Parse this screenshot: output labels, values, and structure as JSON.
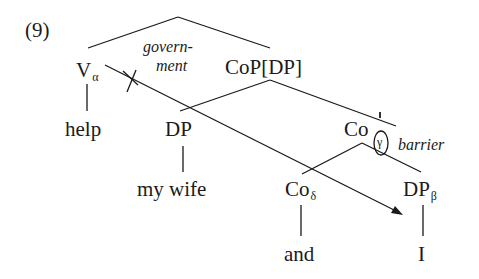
{
  "example": {
    "number": "(9)"
  },
  "nodes": {
    "v": {
      "label": "V",
      "subscript": "α"
    },
    "cop": {
      "label": "CoP[DP]"
    },
    "dp1": {
      "label": "DP"
    },
    "cobar": {
      "label": "Co",
      "prime": "'",
      "circled": "γ"
    },
    "co": {
      "label": "Co",
      "subscript": "δ"
    },
    "dp2": {
      "label": "DP",
      "subscript": "β"
    }
  },
  "leaves": {
    "help": "help",
    "my_wife": "my wife",
    "and": "and",
    "i": "I"
  },
  "annotations": {
    "government_line1": "govern-",
    "government_line2": "ment",
    "barrier": "barrier"
  },
  "colors": {
    "ink": "#1a1a1a",
    "background": "#ffffff"
  }
}
